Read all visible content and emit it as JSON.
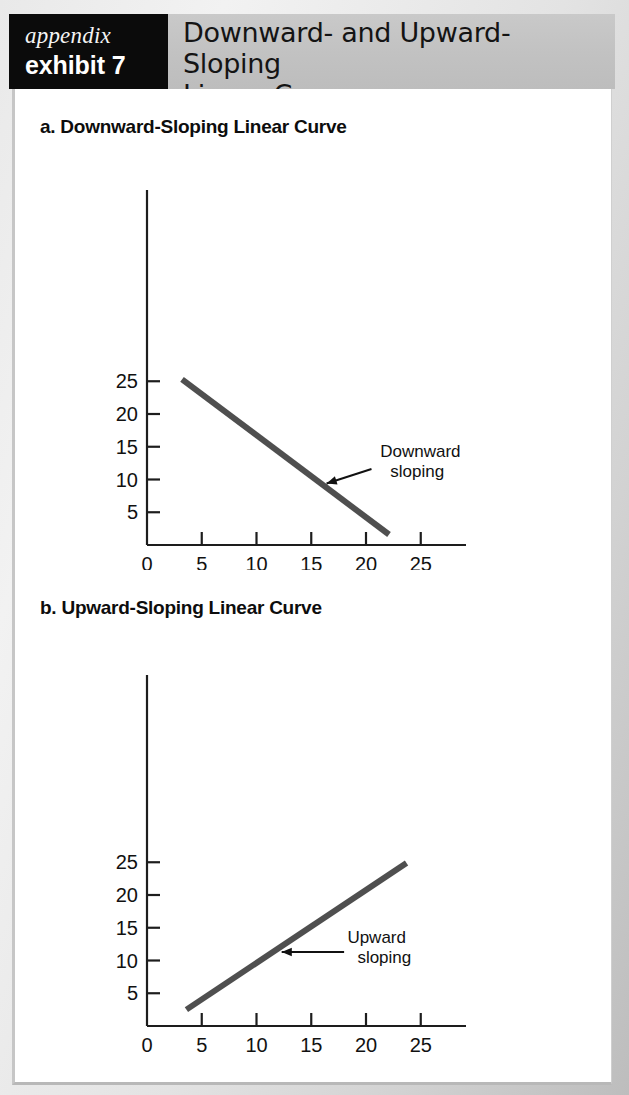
{
  "header": {
    "kicker": "appendix",
    "exhibit_number": "exhibit 7",
    "title_line1": "Downward- and Upward-Sloping",
    "title_line2": "Linear Curve",
    "band_color": "#c2c2c2",
    "tag_bg_color": "#0b0b0b",
    "tag_text_color": "#ffffff"
  },
  "sections": [
    {
      "label": "a. Downward-Sloping Linear Curve"
    },
    {
      "label": "b. Upward-Sloping Linear Curve"
    }
  ],
  "chart_data": [
    {
      "type": "line",
      "title": "a. Downward-Sloping Linear Curve",
      "xlabel": "",
      "ylabel": "",
      "xlim": [
        0,
        29
      ],
      "ylim": [
        0,
        29
      ],
      "xticks": [
        0,
        5,
        10,
        15,
        20,
        25
      ],
      "xtick_labels": [
        "0",
        "5",
        "10",
        "15",
        "20",
        "25"
      ],
      "yticks": [
        5,
        10,
        15,
        20,
        25
      ],
      "ytick_labels": [
        "5",
        "10",
        "15",
        "20",
        "25"
      ],
      "grid": false,
      "legend": "none",
      "series": [
        {
          "name": "Downward sloping",
          "color": "#4f4f4f",
          "line_width": 6,
          "x": [
            3.2,
            22.1
          ],
          "y": [
            25.3,
            1.6
          ]
        }
      ],
      "annotations": [
        {
          "text_line1": "Downward",
          "text_line2": "sloping",
          "text_x": 21.3,
          "text_y": 13.4,
          "arrow_from_x": 20.5,
          "arrow_from_y": 11.6,
          "arrow_to_x": 16.4,
          "arrow_to_y": 9.4
        }
      ]
    },
    {
      "type": "line",
      "title": "b. Upward-Sloping Linear Curve",
      "xlabel": "",
      "ylabel": "",
      "xlim": [
        0,
        29
      ],
      "ylim": [
        0,
        29
      ],
      "xticks": [
        0,
        5,
        10,
        15,
        20,
        25
      ],
      "xtick_labels": [
        "0",
        "5",
        "10",
        "15",
        "20",
        "25"
      ],
      "yticks": [
        5,
        10,
        15,
        20,
        25
      ],
      "ytick_labels": [
        "5",
        "10",
        "15",
        "20",
        "25"
      ],
      "grid": false,
      "legend": "none",
      "series": [
        {
          "name": "Upward sloping",
          "color": "#4f4f4f",
          "line_width": 6,
          "x": [
            3.6,
            23.7
          ],
          "y": [
            2.5,
            24.9
          ]
        }
      ],
      "annotations": [
        {
          "text_line1": "Upward",
          "text_line2": "sloping",
          "text_x": 18.3,
          "text_y": 12.6,
          "arrow_from_x": 18.0,
          "arrow_from_y": 11.3,
          "arrow_to_x": 12.3,
          "arrow_to_y": 11.3
        }
      ]
    }
  ]
}
